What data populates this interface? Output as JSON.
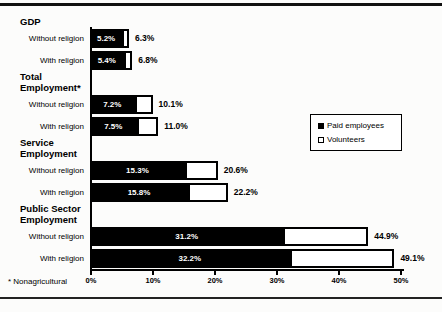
{
  "chart_data": {
    "type": "bar",
    "orientation": "horizontal",
    "stacked": true,
    "axis": {
      "min": 0,
      "max": 50,
      "tick_labels": [
        "0%",
        "10%",
        "20%",
        "30%",
        "40%",
        "50%"
      ],
      "grid": false
    },
    "legend": {
      "position": "middle-right",
      "items": [
        {
          "label": "Paid employees",
          "color": "#000000"
        },
        {
          "label": "Volunteers",
          "color": "#ffffff"
        }
      ]
    },
    "footnote": "* Nonagricultural",
    "groups": [
      {
        "header_lines": [
          "GDP"
        ],
        "rows": [
          {
            "label": "Without religion",
            "paid": 5.2,
            "total": 6.3,
            "paid_label": "5.2%",
            "total_label": "6.3%"
          },
          {
            "label": "With religion",
            "paid": 5.4,
            "total": 6.8,
            "paid_label": "5.4%",
            "total_label": "6.8%"
          }
        ]
      },
      {
        "header_lines": [
          "Total",
          "Employment*"
        ],
        "rows": [
          {
            "label": "Without religion",
            "paid": 7.2,
            "total": 10.1,
            "paid_label": "7.2%",
            "total_label": "10.1%"
          },
          {
            "label": "With religion",
            "paid": 7.5,
            "total": 11.0,
            "paid_label": "7.5%",
            "total_label": "11.0%"
          }
        ]
      },
      {
        "header_lines": [
          "Service",
          "Employment"
        ],
        "rows": [
          {
            "label": "Without religion",
            "paid": 15.3,
            "total": 20.6,
            "paid_label": "15.3%",
            "total_label": "20.6%"
          },
          {
            "label": "With religion",
            "paid": 15.8,
            "total": 22.2,
            "paid_label": "15.8%",
            "total_label": "22.2%"
          }
        ]
      },
      {
        "header_lines": [
          "Public Sector",
          "Employment"
        ],
        "rows": [
          {
            "label": "Without religion",
            "paid": 31.2,
            "total": 44.9,
            "paid_label": "31.2%",
            "total_label": "44.9%"
          },
          {
            "label": "With religion",
            "paid": 32.2,
            "total": 49.1,
            "paid_label": "32.2%",
            "total_label": "49.1%"
          }
        ]
      }
    ],
    "colors": {
      "paid": "#000000",
      "volunteers": "#ffffff",
      "axis": "#000000",
      "background": "#fcfcfb"
    }
  }
}
